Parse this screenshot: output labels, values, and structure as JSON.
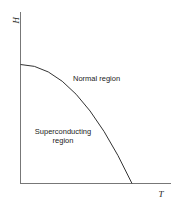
{
  "diagram": {
    "type": "phase-diagram",
    "axes": {
      "x_label": "T",
      "y_label": "H"
    },
    "regions": {
      "normal": "Normal region",
      "superconducting_line1": "Superconducting",
      "superconducting_line2": "region"
    },
    "curve": {
      "description": "critical field boundary H_c(T), parabolic, from H0 at T=0 down to zero at Tc"
    },
    "colors": {
      "line": "#333333",
      "axis": "#666666"
    }
  }
}
